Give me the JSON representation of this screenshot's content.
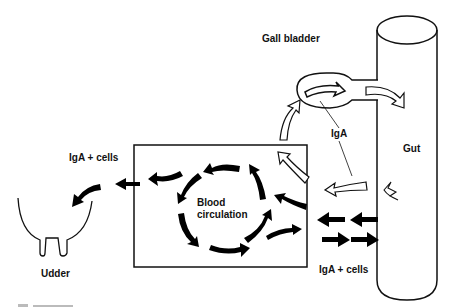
{
  "diagram": {
    "type": "flow-diagram",
    "labels": {
      "gall_bladder": "Gall bladder",
      "iga": "IgA",
      "gut": "Gut",
      "iga_cells_left": "IgA +  cells",
      "iga_cells_bottom": "IgA +  cells",
      "blood_line1": "Blood",
      "blood_line2": "circulation",
      "udder": "Udder"
    },
    "nodes": [
      {
        "id": "gut",
        "label": "Gut",
        "shape": "cylinder"
      },
      {
        "id": "gall_bladder",
        "label": "Gall bladder",
        "shape": "ellipse"
      },
      {
        "id": "blood",
        "label": "Blood circulation",
        "shape": "rectangle"
      },
      {
        "id": "udder",
        "label": "Udder",
        "shape": "udder"
      }
    ],
    "edges": [
      {
        "from": "gut",
        "to": "blood",
        "label": "IgA + cells",
        "style": "solid-black"
      },
      {
        "from": "blood",
        "to": "gut",
        "label": "IgA + cells",
        "style": "solid-black"
      },
      {
        "from": "blood",
        "to": "udder",
        "label": "IgA + cells",
        "style": "solid-black"
      },
      {
        "from": "blood",
        "to": "gall_bladder",
        "label": "IgA",
        "style": "open-white"
      },
      {
        "from": "gall_bladder",
        "to": "gut",
        "label": "IgA",
        "style": "open-white"
      },
      {
        "from": "gut",
        "to": "blood",
        "label": "IgA",
        "style": "open-white"
      }
    ]
  }
}
